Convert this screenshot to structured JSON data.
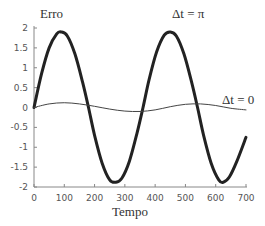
{
  "chart_data": {
    "type": "line",
    "title": "",
    "xlabel": "Tempo",
    "ylabel": "Erro",
    "xlim": [
      0,
      700
    ],
    "ylim": [
      -2,
      2
    ],
    "grid": false,
    "xticks": [
      0,
      100,
      200,
      300,
      400,
      500,
      600,
      700
    ],
    "yticks": [
      2,
      1.5,
      1,
      0.5,
      0,
      -0.5,
      -1,
      -1.5,
      -2
    ],
    "ytick_labels": [
      "2",
      "1.5",
      "1",
      "0.5",
      "0",
      "-0.5",
      "-1",
      "-1.5",
      "-2"
    ],
    "xtick_labels": [
      "0",
      "100",
      "200",
      "300",
      "400",
      "500",
      "600",
      "700"
    ],
    "annotations": [
      {
        "text": "Δt = π",
        "x": 445,
        "y": 2.2,
        "series": "Δt = π"
      },
      {
        "text": "Δt = 0",
        "x": 650,
        "y": 0.25,
        "series": "Δt = 0"
      }
    ],
    "series": [
      {
        "name": "Δt = π",
        "style": "thick",
        "color": "#222222",
        "x": [
          0,
          25,
          50,
          75,
          90,
          110,
          135,
          160,
          180,
          200,
          225,
          250,
          270,
          290,
          315,
          340,
          360,
          380,
          405,
          430,
          450,
          470,
          495,
          520,
          540,
          560,
          585,
          610,
          625,
          645,
          670,
          700
        ],
        "y": [
          0.0,
          0.85,
          1.5,
          1.85,
          1.9,
          1.8,
          1.35,
          0.65,
          0.0,
          -0.7,
          -1.4,
          -1.82,
          -1.88,
          -1.78,
          -1.35,
          -0.65,
          0.0,
          0.7,
          1.4,
          1.82,
          1.9,
          1.8,
          1.35,
          0.65,
          0.0,
          -0.7,
          -1.4,
          -1.82,
          -1.88,
          -1.75,
          -1.35,
          -0.75
        ]
      },
      {
        "name": "Δt = 0",
        "style": "thin",
        "color": "#444444",
        "x": [
          0,
          50,
          100,
          150,
          200,
          250,
          300,
          350,
          400,
          450,
          500,
          550,
          600,
          650,
          700
        ],
        "y": [
          0.0,
          0.09,
          0.12,
          0.09,
          0.03,
          -0.04,
          -0.09,
          -0.1,
          -0.06,
          0.02,
          0.08,
          0.09,
          0.05,
          -0.02,
          -0.06
        ]
      }
    ]
  },
  "labels": {
    "y_axis_title": "Erro",
    "x_axis_title": "Tempo",
    "series_pi_label": "Δt = π",
    "series_zero_label": "Δt = 0"
  }
}
